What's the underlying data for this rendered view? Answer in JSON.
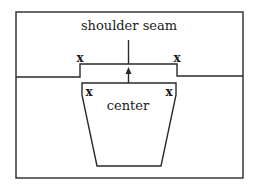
{
  "diagram": {
    "title_label": "shoulder seam",
    "center_label": "center",
    "marks": {
      "shoulder_left": "x",
      "shoulder_right": "x",
      "piece_left": "x",
      "piece_right": "x"
    },
    "colors": {
      "line": "#2a2a2a",
      "background": "#ffffff"
    }
  }
}
